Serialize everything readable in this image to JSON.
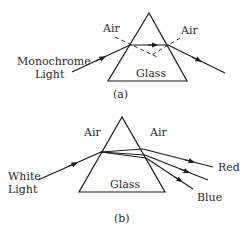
{
  "diagram_a": {
    "caption": "(a)",
    "air_left": "Air",
    "air_right": "Air",
    "glass": "Glass",
    "input_line1": "Monochrome",
    "input_line2": "Light"
  },
  "diagram_b": {
    "caption": "(b)",
    "air_left": "Air",
    "air_right": "Air",
    "glass": "Glass",
    "input_line1": "White",
    "input_line2": "Light",
    "output_red": "Red",
    "output_blue": "Blue"
  },
  "colors": {
    "stroke": "#1a1a1a",
    "text": "#2a2a2a"
  }
}
